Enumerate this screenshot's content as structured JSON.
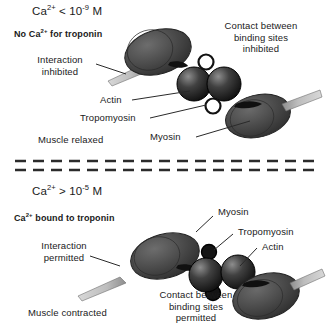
{
  "figure": {
    "panels": [
      {
        "id": "relaxed",
        "state": "relaxed",
        "concentration_label": "Ca2+ < 10-9 M",
        "concentration_parts": {
          "ion": "Ca",
          "ion_charge": "2+",
          "operator": " < 10",
          "exponent": "-9",
          "unit": " M"
        },
        "troponin_status": "No Ca2+ for troponin",
        "troponin_status_parts": {
          "prefix": "No Ca",
          "charge": "2+",
          "suffix": " for troponin"
        },
        "interaction_label": "Interaction\ninhibited",
        "interaction_line1": "Interaction",
        "interaction_line2": "inhibited",
        "contact_line1": "Contact between",
        "contact_line2": "binding sites",
        "contact_line3": "inhibited",
        "muscle_state": "Muscle relaxed",
        "callouts": [
          {
            "name": "actin",
            "label": "Actin"
          },
          {
            "name": "tropomyosin",
            "label": "Tropomyosin"
          },
          {
            "name": "myosin",
            "label": "Myosin"
          }
        ]
      },
      {
        "id": "contracted",
        "state": "contracted",
        "concentration_label": "Ca2+ > 10-5 M",
        "concentration_parts": {
          "ion": "Ca",
          "ion_charge": "2+",
          "operator": " > 10",
          "exponent": "-5",
          "unit": " M"
        },
        "troponin_status": "Ca2+ bound to troponin",
        "troponin_status_parts": {
          "prefix": "Ca",
          "charge": "2+",
          "suffix": " bound to troponin"
        },
        "interaction_line1": "Interaction",
        "interaction_line2": "permitted",
        "contact_line1": "Contact between",
        "contact_line2": "binding sites",
        "contact_line3": "permitted",
        "muscle_state": "Muscle contracted",
        "callouts": [
          {
            "name": "myosin",
            "label": "Myosin"
          },
          {
            "name": "tropomyosin",
            "label": "Tropomyosin"
          },
          {
            "name": "actin",
            "label": "Actin"
          }
        ]
      }
    ],
    "divider": {
      "name": "dashed-separator",
      "style": "double-dashed"
    },
    "colors": {
      "background": "#ffffff",
      "text": "#1a1a1a",
      "myosin_head": "#4b4b4b",
      "myosin_head_dark": "#3a3a3a",
      "myosin_tail": "#b9b9b9",
      "actin_sphere": "#1e1e1e",
      "actin_highlight": "#787878",
      "tropomyosin_ring_open": "#ffffff",
      "tropomyosin_ring_filled": "#141414",
      "leader_line": "#2a2a2a",
      "divider": "#2b2b2b"
    }
  }
}
